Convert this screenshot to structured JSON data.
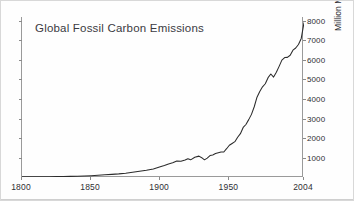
{
  "chart_data": {
    "type": "line",
    "title": "Global Fossil Carbon Emissions",
    "xlabel": "",
    "ylabel": "Million Metric Tons of Carbon / Year",
    "xlim": [
      1800,
      2004
    ],
    "ylim": [
      0,
      8200
    ],
    "grid": false,
    "legend": null,
    "y_axis_position": "right",
    "x_ticks": [
      1800,
      1850,
      1900,
      1950,
      2004
    ],
    "x_tick_labels": [
      "1800",
      "1850",
      "1900",
      "1950",
      "2004"
    ],
    "y_ticks": [
      1000,
      2000,
      3000,
      4000,
      5000,
      6000,
      7000,
      8000
    ],
    "y_tick_labels": [
      "1000",
      "2000",
      "3000",
      "4000",
      "5000",
      "6000",
      "7000",
      "8000"
    ],
    "series": [
      {
        "name": "Global fossil carbon emissions",
        "color": "#2b2b2b",
        "x": [
          1800,
          1805,
          1810,
          1815,
          1820,
          1825,
          1830,
          1835,
          1840,
          1845,
          1850,
          1855,
          1860,
          1865,
          1870,
          1875,
          1880,
          1885,
          1890,
          1895,
          1900,
          1903,
          1906,
          1909,
          1912,
          1915,
          1918,
          1920,
          1922,
          1925,
          1928,
          1930,
          1932,
          1934,
          1936,
          1938,
          1940,
          1942,
          1944,
          1946,
          1948,
          1950,
          1952,
          1954,
          1956,
          1958,
          1960,
          1962,
          1964,
          1966,
          1968,
          1970,
          1972,
          1974,
          1976,
          1978,
          1980,
          1982,
          1984,
          1986,
          1988,
          1990,
          1992,
          1994,
          1996,
          1998,
          2000,
          2002,
          2004
        ],
        "y": [
          8,
          10,
          12,
          15,
          18,
          22,
          27,
          33,
          41,
          52,
          65,
          85,
          110,
          135,
          160,
          195,
          240,
          290,
          345,
          410,
          520,
          590,
          670,
          730,
          820,
          810,
          870,
          935,
          880,
          1010,
          1070,
          990,
          880,
          970,
          1100,
          1130,
          1200,
          1240,
          1280,
          1280,
          1450,
          1630,
          1720,
          1810,
          2040,
          2220,
          2540,
          2690,
          2940,
          3210,
          3600,
          4090,
          4380,
          4620,
          4780,
          5090,
          5280,
          5120,
          5370,
          5670,
          5990,
          6120,
          6130,
          6240,
          6500,
          6610,
          6790,
          7100,
          7910
        ]
      }
    ]
  },
  "title": {
    "text": "Global Fossil Carbon Emissions"
  }
}
